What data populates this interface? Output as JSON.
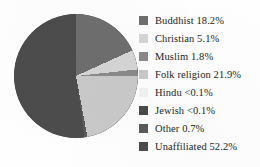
{
  "chart_data": {
    "type": "pie",
    "title": "",
    "xlabel": "",
    "ylabel": "",
    "legend_position": "right",
    "grid": false,
    "start_angle_deg": 0,
    "direction": "clockwise",
    "categories": [
      "Buddhist",
      "Christian",
      "Muslim",
      "Folk religion",
      "Hindu",
      "Jewish",
      "Other",
      "Unaffiliated"
    ],
    "values": [
      18.2,
      5.1,
      1.8,
      21.9,
      0.05,
      0.05,
      0.7,
      52.2
    ],
    "value_labels": [
      "18.2%",
      "5.1%",
      "1.8%",
      "21.9%",
      "<0.1%",
      "<0.1%",
      "0.7%",
      "52.2%"
    ],
    "colors": [
      "#6e6e6e",
      "#d5d5d5",
      "#8a8a8a",
      "#c9c9c9",
      "#f2f2f2",
      "#4a4a4a",
      "#5a5a5a",
      "#4c4c4c"
    ]
  },
  "legend": {
    "items": [
      {
        "label": "Buddhist 18.2%",
        "name": "Buddhist",
        "value": "18.2%",
        "color": "#6e6e6e"
      },
      {
        "label": "Christian 5.1%",
        "name": "Christian",
        "value": "5.1%",
        "color": "#d5d5d5"
      },
      {
        "label": "Muslim 1.8%",
        "name": "Muslim",
        "value": "1.8%",
        "color": "#8a8a8a"
      },
      {
        "label": "Folk religion 21.9%",
        "name": "Folk religion",
        "value": "21.9%",
        "color": "#c9c9c9"
      },
      {
        "label": "Hindu  <0.1%",
        "name": "Hindu",
        "value": "<0.1%",
        "color": "#f2f2f2"
      },
      {
        "label": "Jewish <0.1%",
        "name": "Jewish",
        "value": "<0.1%",
        "color": "#4a4a4a"
      },
      {
        "label": "Other 0.7%",
        "name": "Other",
        "value": "0.7%",
        "color": "#5a5a5a"
      },
      {
        "label": "Unaffiliated 52.2%",
        "name": "Unaffiliated",
        "value": "52.2%",
        "color": "#4c4c4c"
      }
    ]
  }
}
